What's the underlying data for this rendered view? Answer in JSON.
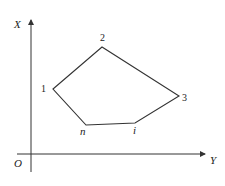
{
  "diagram": {
    "type": "polygon-in-coordinate-system",
    "axes": {
      "vertical_label": "X",
      "horizontal_label": "Y",
      "origin_label": "O"
    },
    "vertices": [
      {
        "id": "1",
        "label": "1",
        "x": 53,
        "y": 89
      },
      {
        "id": "2",
        "label": "2",
        "x": 102,
        "y": 47
      },
      {
        "id": "3",
        "label": "3",
        "x": 179,
        "y": 96
      },
      {
        "id": "i",
        "label": "i",
        "x": 135,
        "y": 123
      },
      {
        "id": "n",
        "label": "n",
        "x": 86,
        "y": 125
      }
    ],
    "edge_order": [
      "1",
      "2",
      "3",
      "i",
      "n",
      "1"
    ],
    "colors": {
      "line": "#333333",
      "background": "#ffffff"
    }
  }
}
